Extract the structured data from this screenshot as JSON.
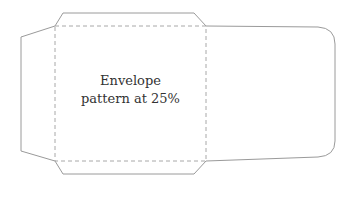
{
  "diagram": {
    "label_line1": "Envelope",
    "label_line2": "pattern at 25%",
    "colors": {
      "outline": "#9a9a9a",
      "fold": "#a8a8a8"
    }
  }
}
